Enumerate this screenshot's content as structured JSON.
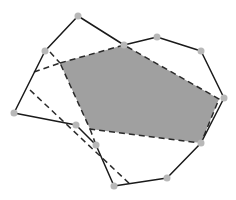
{
  "diagram": {
    "type": "polygon-intersection",
    "colors": {
      "background": "#ffffff",
      "stroke": "#1a1a1a",
      "shaded_fill": "#a0a0a0",
      "vertex": "#b8b8b8"
    },
    "outer_polygon": {
      "style": "solid",
      "vertices": [
        [
          45,
          51
        ],
        [
          78,
          16
        ],
        [
          124,
          45
        ],
        [
          157,
          37
        ],
        [
          201,
          51
        ],
        [
          224,
          98
        ],
        [
          201,
          143
        ],
        [
          167,
          178
        ],
        [
          114,
          186
        ],
        [
          96,
          145
        ],
        [
          76,
          125
        ],
        [
          14,
          113
        ]
      ]
    },
    "shaded_polygon": {
      "style": "dashed",
      "vertices": [
        [
          60,
          63
        ],
        [
          124,
          45
        ],
        [
          219,
          99
        ],
        [
          201,
          143
        ],
        [
          90,
          129
        ]
      ]
    },
    "dashed_lines": [
      {
        "from": [
          50,
          52
        ],
        "to": [
          60,
          63
        ]
      },
      {
        "from": [
          34,
          72
        ],
        "to": [
          60,
          63
        ]
      },
      {
        "from": [
          90,
          129
        ],
        "to": [
          96,
          145
        ]
      },
      {
        "from": [
          30,
          90
        ],
        "to": [
          132,
          186
        ]
      }
    ],
    "vertex_markers": [
      [
        78,
        16
      ],
      [
        45,
        51
      ],
      [
        14,
        113
      ],
      [
        76,
        125
      ],
      [
        96,
        145
      ],
      [
        114,
        186
      ],
      [
        167,
        178
      ],
      [
        201,
        143
      ],
      [
        224,
        98
      ],
      [
        201,
        51
      ],
      [
        157,
        37
      ],
      [
        124,
        45
      ]
    ]
  }
}
